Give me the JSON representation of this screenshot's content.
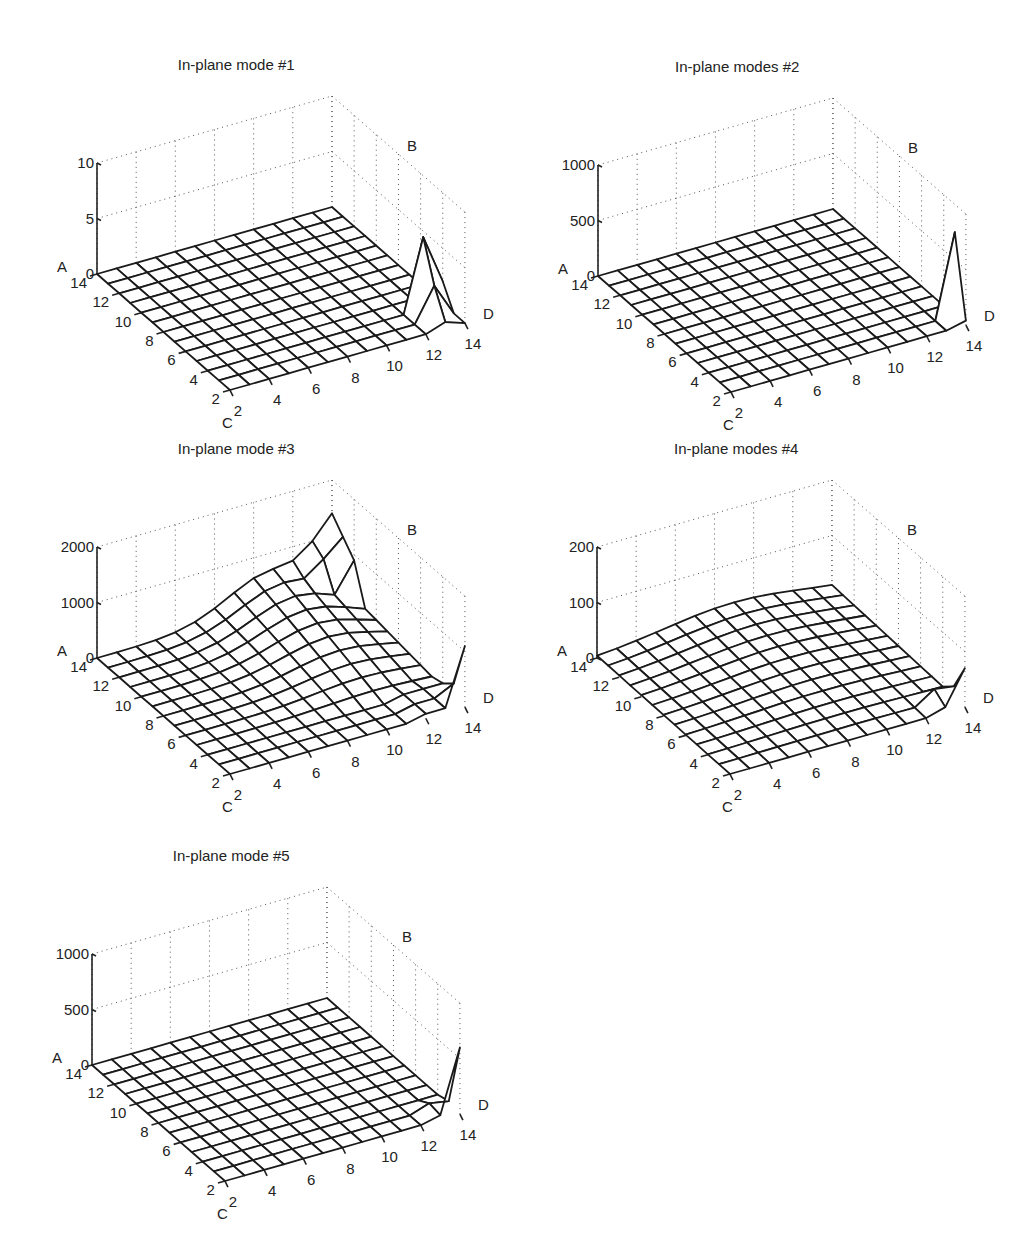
{
  "figure": {
    "panels": [
      {
        "id": "p1",
        "title": "In-plane mode #1",
        "zmax": 10,
        "zticks": [
          "0",
          "5",
          "10"
        ],
        "origin": [
          97,
          274
        ]
      },
      {
        "id": "p2",
        "title": "In-plane modes #2",
        "zmax": 1000,
        "zticks": [
          "0",
          "500",
          "1000"
        ],
        "origin": [
          598,
          276
        ]
      },
      {
        "id": "p3",
        "title": "In-plane mode #3",
        "zmax": 2000,
        "zticks": [
          "0",
          "1000",
          "2000"
        ],
        "origin": [
          97,
          658
        ]
      },
      {
        "id": "p4",
        "title": "In-plane modes #4",
        "zmax": 200,
        "zticks": [
          "0",
          "100",
          "200"
        ],
        "origin": [
          597,
          658
        ]
      },
      {
        "id": "p5",
        "title": "In-plane mode #5",
        "zmax": 1000,
        "zticks": [
          "0",
          "500",
          "1000"
        ],
        "origin": [
          92,
          1065
        ]
      }
    ],
    "axis_labels": {
      "z": "A",
      "back": "B",
      "front": "C",
      "right": "D"
    },
    "left_ticks": [
      "14",
      "12",
      "10",
      "8",
      "6",
      "4",
      "2"
    ],
    "bottom_ticks": [
      "2",
      "4",
      "6",
      "8",
      "10",
      "12",
      "14"
    ]
  },
  "chart_data": [
    {
      "type": "surface",
      "title": "In-plane mode #1",
      "axes": {
        "z_label": "A",
        "back_label": "B",
        "left_axis_label": "C",
        "right_axis_label": "D"
      },
      "x_ticks": [
        2,
        4,
        6,
        8,
        10,
        12,
        14
      ],
      "y_ticks": [
        2,
        4,
        6,
        8,
        10,
        12,
        14
      ],
      "zlim": [
        0,
        10
      ],
      "z_ticks": [
        0,
        5,
        10
      ],
      "grid": "13x13 mesh, indices 2..14",
      "description": "Flat at ~0 everywhere except a sharp peak near the D-axis end (left-axis ~3-4, right-axis ~13), max ~6.5",
      "features": [
        {
          "left": 4,
          "right": 13,
          "z": 6.5
        },
        {
          "left": 3,
          "right": 13,
          "z": 3
        },
        {
          "left": 4,
          "right": 14,
          "z": 2
        }
      ]
    },
    {
      "type": "surface",
      "title": "In-plane modes #2",
      "axes": {
        "z_label": "A",
        "back_label": "B",
        "left_axis_label": "C",
        "right_axis_label": "D"
      },
      "x_ticks": [
        2,
        4,
        6,
        8,
        10,
        12,
        14
      ],
      "y_ticks": [
        2,
        4,
        6,
        8,
        10,
        12,
        14
      ],
      "zlim": [
        0,
        1000
      ],
      "z_ticks": [
        0,
        500,
        1000
      ],
      "description": "Flat at ~0 with a single narrow spike at the right corner, max ~750",
      "features": [
        {
          "left": 3,
          "right": 14,
          "z": 750
        }
      ]
    },
    {
      "type": "surface",
      "title": "In-plane mode #3",
      "axes": {
        "z_label": "A",
        "back_label": "B",
        "left_axis_label": "C",
        "right_axis_label": "D"
      },
      "x_ticks": [
        2,
        4,
        6,
        8,
        10,
        12,
        14
      ],
      "y_ticks": [
        2,
        4,
        6,
        8,
        10,
        12,
        14
      ],
      "zlim": [
        0,
        2000
      ],
      "z_ticks": [
        0,
        1000,
        2000
      ],
      "description": "Surface rises gently toward back corner (~1000-1400 at left=14,right=14 region), dips near D edge, sharp spike at right corner ~1100",
      "features": [
        {
          "left": 14,
          "right": 14,
          "z": 1400
        },
        {
          "left": 2,
          "right": 14,
          "z": 1100
        }
      ]
    },
    {
      "type": "surface",
      "title": "In-plane modes #4",
      "axes": {
        "z_label": "A",
        "back_label": "B",
        "left_axis_label": "C",
        "right_axis_label": "D"
      },
      "x_ticks": [
        2,
        4,
        6,
        8,
        10,
        12,
        14
      ],
      "y_ticks": [
        2,
        4,
        6,
        8,
        10,
        12,
        14
      ],
      "zlim": [
        0,
        200
      ],
      "z_ticks": [
        0,
        100,
        200
      ],
      "description": "Nearly flat with slight rise toward back (~30), small bump and spike near right corner ~70",
      "features": [
        {
          "left": 2,
          "right": 14,
          "z": 70
        },
        {
          "left": 3,
          "right": 13,
          "z": 25
        }
      ]
    },
    {
      "type": "surface",
      "title": "In-plane mode #5",
      "axes": {
        "z_label": "A",
        "back_label": "B",
        "left_axis_label": "C",
        "right_axis_label": "D"
      },
      "x_ticks": [
        2,
        4,
        6,
        8,
        10,
        12,
        14
      ],
      "y_ticks": [
        2,
        4,
        6,
        8,
        10,
        12,
        14
      ],
      "zlim": [
        0,
        1000
      ],
      "z_ticks": [
        0,
        500,
        1000
      ],
      "description": "Flat at ~0 with a narrow spike at right corner, max ~600",
      "features": [
        {
          "left": 2,
          "right": 14,
          "z": 600
        },
        {
          "left": 3,
          "right": 13,
          "z": 60
        }
      ]
    }
  ]
}
